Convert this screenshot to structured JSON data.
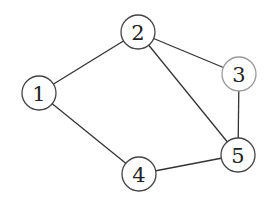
{
  "graph": {
    "nodes": [
      {
        "id": "1",
        "label": "1",
        "x": 39,
        "y": 93,
        "r": 17,
        "stroke": "#444444"
      },
      {
        "id": "2",
        "label": "2",
        "x": 138,
        "y": 32,
        "r": 17,
        "stroke": "#444444"
      },
      {
        "id": "3",
        "label": "3",
        "x": 239,
        "y": 74,
        "r": 17,
        "stroke": "#9a9a9a"
      },
      {
        "id": "4",
        "label": "4",
        "x": 139,
        "y": 174,
        "r": 17,
        "stroke": "#444444"
      },
      {
        "id": "5",
        "label": "5",
        "x": 238,
        "y": 155,
        "r": 17,
        "stroke": "#444444"
      }
    ],
    "edges": [
      {
        "from": "1",
        "to": "2"
      },
      {
        "from": "1",
        "to": "4"
      },
      {
        "from": "2",
        "to": "3"
      },
      {
        "from": "2",
        "to": "5"
      },
      {
        "from": "3",
        "to": "5"
      },
      {
        "from": "4",
        "to": "5"
      }
    ]
  }
}
